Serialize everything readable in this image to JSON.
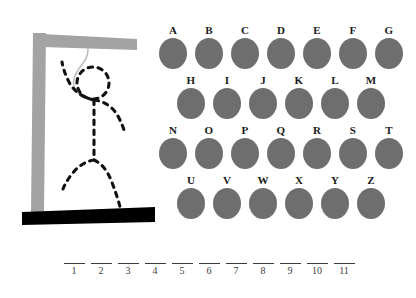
{
  "game": {
    "title": "Hangman",
    "background_color": "#ffffff"
  },
  "gallows": {
    "post_color": "#a3a3a3",
    "beam_color": "#a3a3a3",
    "base_color": "#000000",
    "rope_color": "#bdbdbd",
    "figure_color": "#111111",
    "parts_drawn": [
      "post",
      "beam",
      "base",
      "rope",
      "head",
      "arms",
      "torso",
      "legs"
    ]
  },
  "letters": {
    "disc_color": "#6e6e6e",
    "label_color": "#1a1a1a",
    "rows": [
      {
        "indent": 0,
        "items": [
          {
            "label": "A",
            "state": "available"
          },
          {
            "label": "B",
            "state": "available"
          },
          {
            "label": "C",
            "state": "available"
          },
          {
            "label": "D",
            "state": "available"
          },
          {
            "label": "E",
            "state": "available"
          },
          {
            "label": "F",
            "state": "available"
          },
          {
            "label": "G",
            "state": "available"
          }
        ]
      },
      {
        "indent": 18,
        "items": [
          {
            "label": "H",
            "state": "available"
          },
          {
            "label": "I",
            "state": "available"
          },
          {
            "label": "J",
            "state": "available"
          },
          {
            "label": "K",
            "state": "available"
          },
          {
            "label": "L",
            "state": "available"
          },
          {
            "label": "M",
            "state": "available"
          }
        ]
      },
      {
        "indent": 0,
        "items": [
          {
            "label": "N",
            "state": "available"
          },
          {
            "label": "O",
            "state": "available"
          },
          {
            "label": "P",
            "state": "available"
          },
          {
            "label": "Q",
            "state": "available"
          },
          {
            "label": "R",
            "state": "available"
          },
          {
            "label": "S",
            "state": "available"
          },
          {
            "label": "T",
            "state": "available"
          }
        ]
      },
      {
        "indent": 18,
        "items": [
          {
            "label": "U",
            "state": "available"
          },
          {
            "label": "V",
            "state": "available"
          },
          {
            "label": "W",
            "state": "available"
          },
          {
            "label": "X",
            "state": "available"
          },
          {
            "label": "Y",
            "state": "available"
          },
          {
            "label": "Z",
            "state": "available"
          }
        ]
      }
    ]
  },
  "answer": {
    "length": 11,
    "slots": [
      {
        "number": "1",
        "letter": ""
      },
      {
        "number": "2",
        "letter": ""
      },
      {
        "number": "3",
        "letter": ""
      },
      {
        "number": "4",
        "letter": ""
      },
      {
        "number": "5",
        "letter": ""
      },
      {
        "number": "6",
        "letter": ""
      },
      {
        "number": "7",
        "letter": ""
      },
      {
        "number": "8",
        "letter": ""
      },
      {
        "number": "9",
        "letter": ""
      },
      {
        "number": "10",
        "letter": ""
      },
      {
        "number": "11",
        "letter": ""
      }
    ]
  }
}
